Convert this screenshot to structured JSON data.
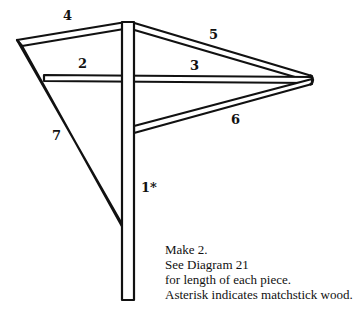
{
  "diagram": {
    "pieces": [
      {
        "id": "1",
        "label": "1*",
        "description": "vertical post (matchstick wood)"
      },
      {
        "id": "2",
        "label": "2",
        "description": "horizontal crossbar left"
      },
      {
        "id": "3",
        "label": "3",
        "description": "horizontal crossbar right"
      },
      {
        "id": "4",
        "label": "4",
        "description": "top-left strut"
      },
      {
        "id": "5",
        "label": "5",
        "description": "top-right diagonal"
      },
      {
        "id": "6",
        "label": "6",
        "description": "lower-right diagonal"
      },
      {
        "id": "7",
        "label": "7",
        "description": "left diagonal brace"
      }
    ],
    "notes": [
      "Make 2.",
      "See Diagram 21",
      "for length of each piece.",
      "Asterisk indicates matchstick wood."
    ],
    "stroke_color": "#111111",
    "background": "#ffffff"
  }
}
